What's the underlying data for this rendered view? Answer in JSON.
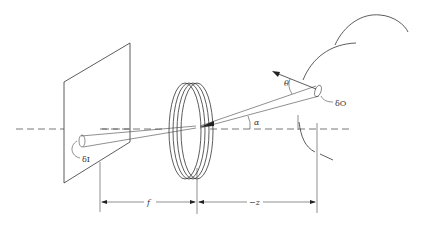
{
  "diagram": {
    "type": "optical-imaging-geometry",
    "labels": {
      "theta": "θ",
      "alpha": "α",
      "object_element": "δO",
      "image_element": "δI",
      "focal_length": "f",
      "object_distance": "−z"
    },
    "components": [
      "image-plane",
      "lens",
      "object-surface",
      "optical-axis",
      "light-cone",
      "surface-normal",
      "dimension-lines"
    ],
    "colors": {
      "line": "#333333",
      "background": "#ffffff"
    }
  }
}
